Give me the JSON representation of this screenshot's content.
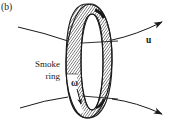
{
  "figure": {
    "panel_label": "(b)",
    "velocity_label": "u",
    "ring_label_line1": "Smoke",
    "ring_label_line2": "ring",
    "vorticity_label": "ω"
  },
  "colors": {
    "ink": "#1a1a1a",
    "background": "#ffffff",
    "ring_fill": "#ffffff"
  }
}
